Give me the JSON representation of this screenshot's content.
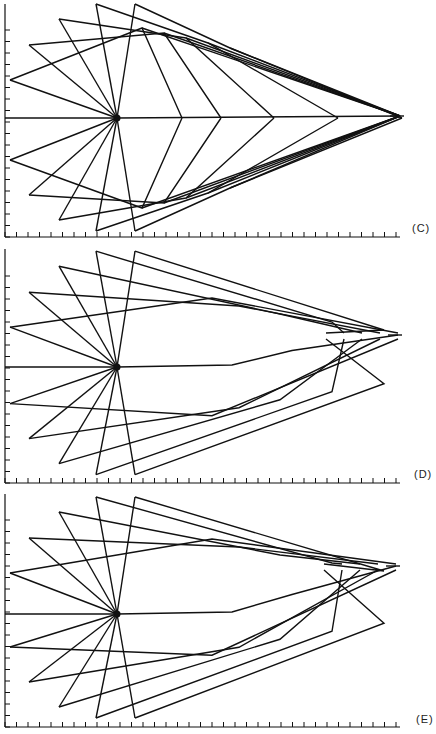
{
  "figure": {
    "panels": [
      {
        "label": "(C)",
        "origin_y": 0,
        "axis_y": 237,
        "center": [
          117,
          118
        ],
        "tip": [
          400,
          116
        ]
      },
      {
        "label": "(D)",
        "origin_y": 245,
        "axis_y": 483,
        "center": [
          117,
          367
        ],
        "tip": [
          398,
          335
        ]
      },
      {
        "label": "(E)",
        "origin_y": 490,
        "axis_y": 727,
        "center": [
          117,
          614
        ],
        "tip": [
          396,
          566
        ]
      }
    ],
    "axes": {
      "x_ticks": 35,
      "y_ticks": 19,
      "tick_spacing_px": 11.5
    },
    "line_color": "#111111"
  }
}
